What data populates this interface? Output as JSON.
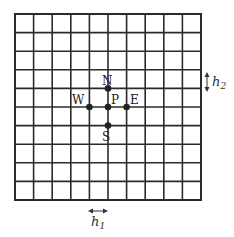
{
  "diagram": {
    "type": "finite-difference-grid",
    "grid": {
      "columns": 10,
      "rows": 10,
      "origin_x": 15,
      "origin_y": 14,
      "cell_size": 18.6,
      "line_color": "#2a2a2a"
    },
    "stencil": {
      "center": {
        "label": "P",
        "col": 5,
        "row": 5
      },
      "neighbors": [
        {
          "label": "N",
          "col": 5,
          "row": 4
        },
        {
          "label": "S",
          "col": 5,
          "row": 6
        },
        {
          "label": "W",
          "col": 4,
          "row": 5
        },
        {
          "label": "E",
          "col": 6,
          "row": 5
        }
      ],
      "node_color": "#222222"
    },
    "spacing_labels": {
      "h1": {
        "base": "h",
        "subscript": "1",
        "meaning": "horizontal spacing"
      },
      "h2": {
        "base": "h",
        "subscript": "2",
        "meaning": "vertical spacing"
      }
    }
  }
}
